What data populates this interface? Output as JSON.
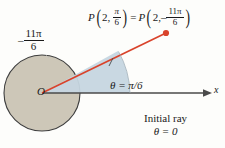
{
  "figure": {
    "title_text": "Polar coordinates point P shown with positive and negative angle measures",
    "background_color": "#fdfdfb",
    "point_label": {
      "p_symbol": "P",
      "radius": "2",
      "angle_positive_numerator": "π",
      "angle_positive_denominator": "6",
      "equals": "=",
      "p_symbol_2": "P",
      "radius_2": "2",
      "minus_sign": "–",
      "angle_negative_numerator": "11π",
      "angle_negative_denominator": "6",
      "comma": ","
    },
    "negative_angle_label": {
      "minus_sign": "–",
      "numerator": "11π",
      "denominator": "6"
    },
    "theta_label": "θ = π/6",
    "origin_label": "O",
    "x_axis_label": "x",
    "initial_ray_caption": {
      "line1": "Initial ray",
      "line2": "θ = 0"
    },
    "colors": {
      "circle_fill": "#cdc7b8",
      "circle_stroke": "#3d3d3d",
      "sector_fill": "#c6d6e0",
      "ray_red": "#d9432b",
      "axis_gray": "#4a4a4a",
      "text": "#1a1a1a"
    },
    "geometry": {
      "origin_x": 42,
      "origin_y": 93,
      "circle_radius": 38,
      "point_x": 166,
      "point_y": 33,
      "axis_end_x": 211,
      "theta_degrees": 30
    }
  }
}
